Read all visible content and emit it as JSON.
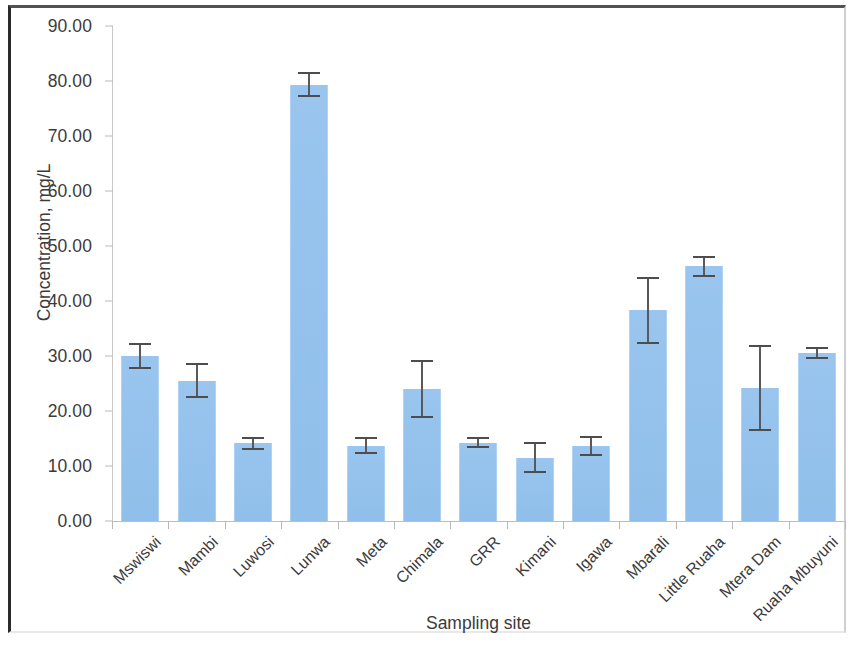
{
  "chart_data": {
    "type": "bar",
    "title": "",
    "xlabel": "Sampling site",
    "ylabel": "Concentration, mg/L",
    "ylim": [
      0,
      90
    ],
    "ytick_labels": [
      "90.00",
      "80.00",
      "70.00",
      "60.00",
      "50.00",
      "40.00",
      "30.00",
      "20.00",
      "10.00",
      "0.00"
    ],
    "ytick_values": [
      90,
      80,
      70,
      60,
      50,
      40,
      30,
      20,
      10,
      0
    ],
    "grid": false,
    "legend": "none",
    "bar_color": "#95c2ec",
    "error_bar_color": "#59595b",
    "error_bar_type": "symmetric",
    "categories": [
      "Mswiswi",
      "Mambi",
      "Luwosi",
      "Lunwa",
      "Meta",
      "Chimala",
      "GRR",
      "Kimani",
      "Igawa",
      "Mbarali",
      "Little Ruaha",
      "Mtera Dam",
      "Ruaha Mbuyuni"
    ],
    "values": [
      30.0,
      25.5,
      14.1,
      79.3,
      13.7,
      24.0,
      14.2,
      11.5,
      13.6,
      38.3,
      46.3,
      24.2,
      30.5
    ],
    "errors": [
      2.3,
      3.2,
      1.2,
      2.3,
      1.5,
      5.2,
      1.0,
      2.8,
      1.8,
      6.1,
      1.9,
      7.8,
      1.1
    ],
    "series": [
      {
        "name": "Concentration",
        "values": [
          30.0,
          25.5,
          14.1,
          79.3,
          13.7,
          24.0,
          14.2,
          11.5,
          13.6,
          38.3,
          46.3,
          24.2,
          30.5
        ],
        "errors": [
          2.3,
          3.2,
          1.2,
          2.3,
          1.5,
          5.2,
          1.0,
          2.8,
          1.8,
          6.1,
          1.9,
          7.8,
          1.1
        ]
      }
    ]
  }
}
